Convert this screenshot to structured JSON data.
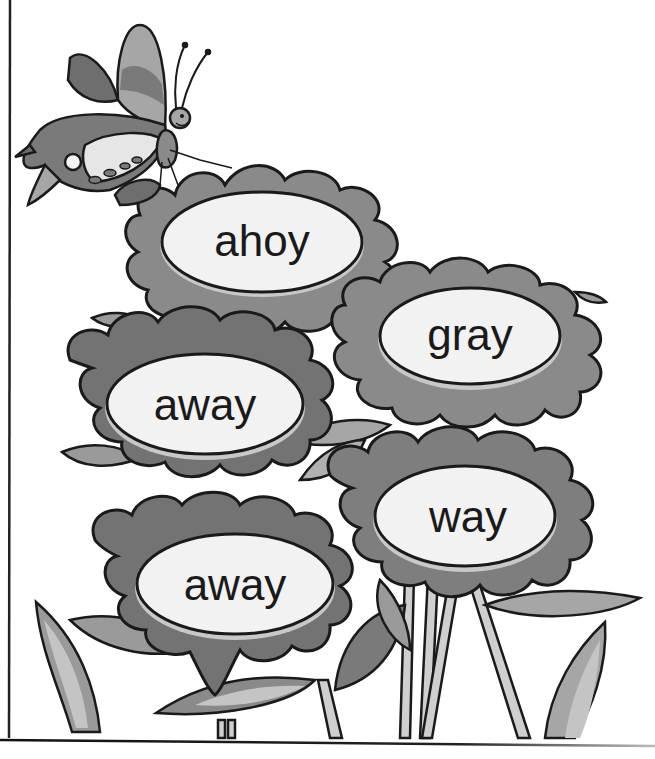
{
  "worksheet": {
    "flowers": [
      {
        "id": "flower-1",
        "word": "ahoy"
      },
      {
        "id": "flower-2",
        "word": "gray"
      },
      {
        "id": "flower-3",
        "word": "away"
      },
      {
        "id": "flower-4",
        "word": "way"
      },
      {
        "id": "flower-5",
        "word": "away"
      }
    ],
    "decorations": {
      "butterfly": "butterfly-icon"
    },
    "colors": {
      "outline": "#1a1a1a",
      "petal_dark": "#6e6e6e",
      "petal_mid": "#8a8a8a",
      "petal_light": "#a6a6a6",
      "center_fill": "#f2f2f2",
      "leaf": "#9a9a9a",
      "leaf_light": "#c4c4c4",
      "stem": "#cfcfcf",
      "background": "#ffffff"
    }
  }
}
